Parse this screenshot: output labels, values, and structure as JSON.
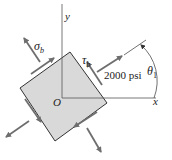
{
  "diagram": {
    "axes": {
      "y_label": "y",
      "x_label": "x",
      "origin_label": "O"
    },
    "labels": {
      "normal_stress": "σ",
      "normal_stress_sub": "b",
      "shear_stress": "τ",
      "shear_stress_sub": "b",
      "stress_value": "2000 psi",
      "angle": "θ",
      "angle_sub": "1"
    },
    "colors": {
      "element_fill": "#d9d9d9",
      "element_stroke": "#333333",
      "arrow": "#6e6e6e",
      "axis": "#555555"
    }
  }
}
